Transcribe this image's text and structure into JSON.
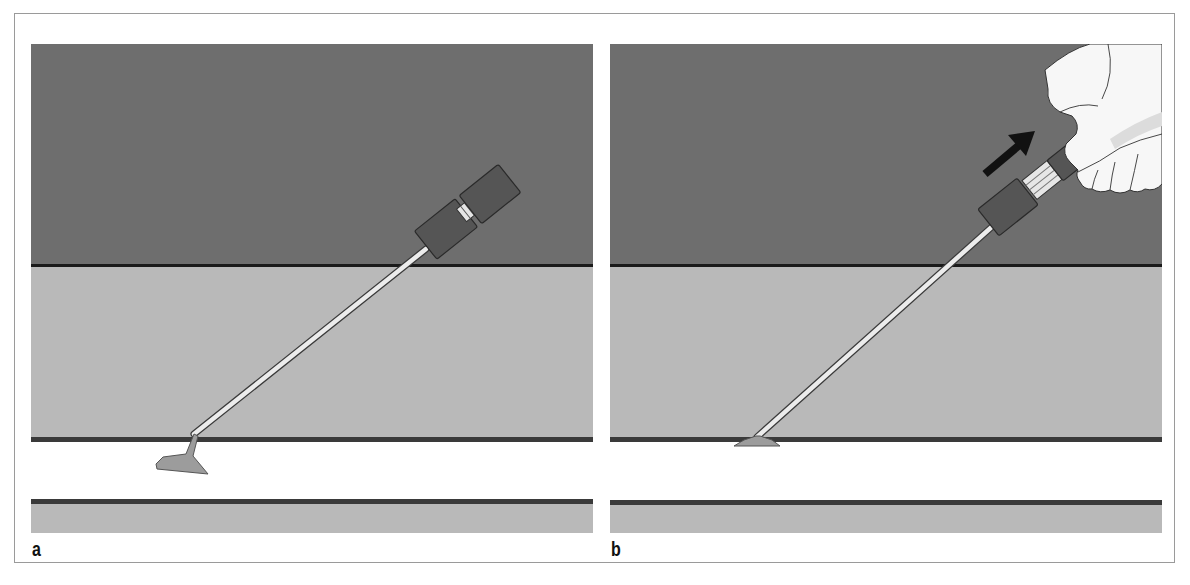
{
  "figure": {
    "panels": [
      {
        "label": "a",
        "description": "Instrument with flared tip positioned in the lumen below the layer boundary",
        "tip_state": "in-lumen",
        "hand_present": false,
        "arrow_present": false
      },
      {
        "label": "b",
        "description": "Hand pulls the instrument back; flared tip seated against the inner layer boundary",
        "tip_state": "seated-against-wall",
        "hand_present": true,
        "arrow_present": true,
        "arrow_direction": "up-right"
      }
    ],
    "colors": {
      "dark_band": "#6e6e6e",
      "light_band": "#b9b9b9",
      "boundary_line": "#2a2a2a",
      "lumen": "#ffffff",
      "connector": "#565656",
      "shaft": "#e8e8e8",
      "tip": "#9c9c9c",
      "hand": "#f7f7f7",
      "arrow": "#111111"
    }
  }
}
